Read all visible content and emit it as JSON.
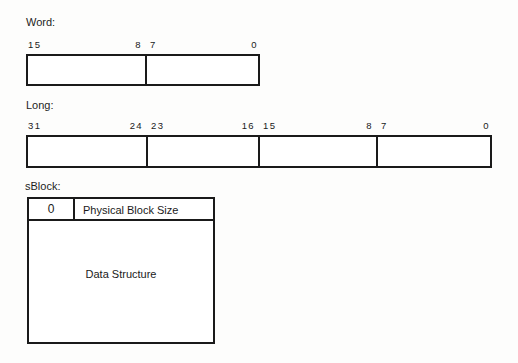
{
  "sections": {
    "word": {
      "caption": "Word:",
      "labels": {
        "msb": "15",
        "mid_high": "8",
        "mid_low": "7",
        "lsb": "0"
      }
    },
    "long": {
      "caption": "Long:",
      "labels": {
        "b31": "31",
        "b24": "24",
        "b23": "23",
        "b16": "16",
        "b15": "15",
        "b8": "8",
        "b7": "7",
        "b0": "0"
      }
    },
    "sblock": {
      "caption": "sBlock:",
      "flag_cell": "0",
      "size_cell": "Physical Block Size",
      "body_cell": "Data Structure"
    }
  },
  "style": {
    "line_color": "#1a1a1a",
    "fill_color": "#ffffff",
    "page_background": "#fdfdfc"
  }
}
